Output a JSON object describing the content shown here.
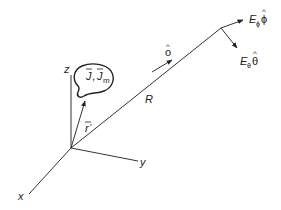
{
  "diagram": {
    "type": "antenna-radiation-geometry",
    "axes": {
      "x_label": "x",
      "y_label": "y",
      "z_label": "z"
    },
    "source": {
      "label_j": "J",
      "label_jm": "J",
      "label_jm_sub": "m",
      "separator": ","
    },
    "vectors": {
      "r_prime_label": "r",
      "r_prime_mark": "′",
      "R_label": "R",
      "o_hat_label": "o",
      "hat": "^",
      "e_phi_label": "E",
      "e_phi_sub": "ϕ",
      "e_phi_unit": "ϕ",
      "e_theta_label": "E",
      "e_theta_sub": "θ",
      "e_theta_unit": "θ"
    },
    "colors": {
      "line": "#333333",
      "text": "#222222",
      "background": "#ffffff"
    }
  }
}
